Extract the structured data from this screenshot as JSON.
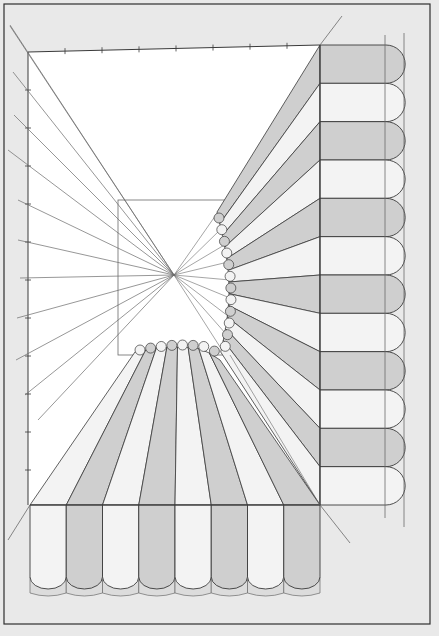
{
  "diagram": {
    "title": "",
    "colors": {
      "background": "#e9e9e9",
      "paper": "#ffffff",
      "stripe_dark": "#cfcfcf",
      "stripe_light": "#f3f3f3",
      "scallop_trim": "#dcdcdc",
      "line": "#3a3a3a",
      "guide_line": "#6a6a6a",
      "frame": "#2f2f2f"
    },
    "vanishing_point": {
      "x": 174,
      "y": 275
    },
    "inner_rectangle": {
      "x": 118,
      "y": 200,
      "width": 112,
      "height": 155
    },
    "picture_plane": {
      "x": 28,
      "y": 52,
      "width": 292,
      "height": 453
    },
    "right_band": {
      "stripes": 12,
      "x_start": 320,
      "x_end": 386
    },
    "bottom_band": {
      "stripes": 8,
      "y_start": 505,
      "y_end": 585
    }
  }
}
